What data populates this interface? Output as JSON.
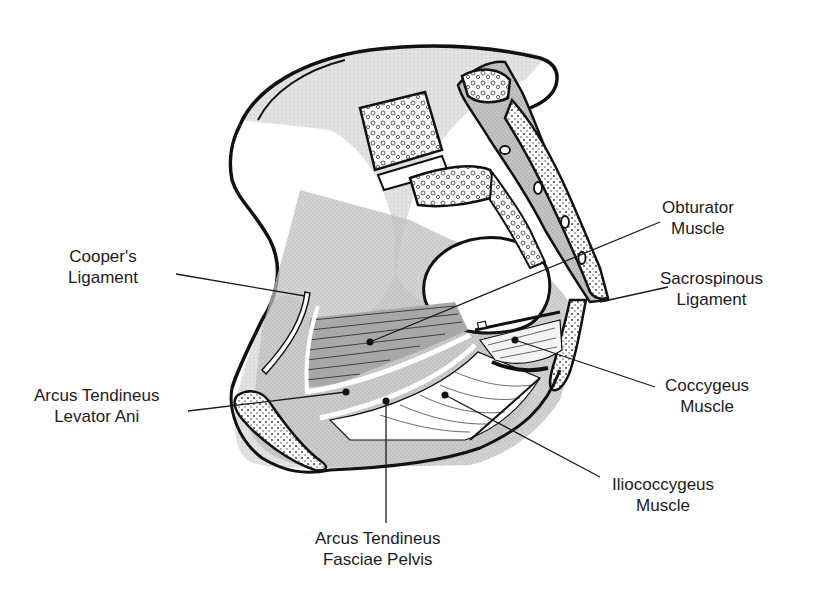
{
  "diagram": {
    "colors": {
      "outline": "#111111",
      "shade_light": "#d8d8d8",
      "shade_mid": "#b4b4b4",
      "shade_dark": "#9a9a9a",
      "bone": "#ffffff"
    },
    "labels": [
      {
        "id": "coopers-ligament",
        "line1": "Cooper's",
        "line2": "Ligament",
        "x": 68,
        "y": 246
      },
      {
        "id": "obturator-muscle",
        "line1": "Obturator",
        "line2": "Muscle",
        "x": 662,
        "y": 197
      },
      {
        "id": "sacrospinous-ligament",
        "line1": "Sacrospinous",
        "line2": "Ligament",
        "x": 660,
        "y": 268
      },
      {
        "id": "arcus-tendineus-levator-ani",
        "line1": "Arcus Tendineus",
        "line2": "Levator Ani",
        "x": 34,
        "y": 385
      },
      {
        "id": "coccygeus-muscle",
        "line1": "Coccygeus",
        "line2": "Muscle",
        "x": 665,
        "y": 375
      },
      {
        "id": "iliococcygeus-muscle",
        "line1": "Iliococcygeus",
        "line2": "Muscle",
        "x": 612,
        "y": 474
      },
      {
        "id": "arcus-tendineus-fasciae-pelvis",
        "line1": "Arcus Tendineus",
        "line2": "Fasciae Pelvis",
        "x": 315,
        "y": 528
      }
    ]
  }
}
